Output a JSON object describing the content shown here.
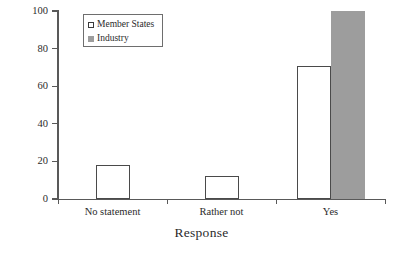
{
  "chart_data": {
    "type": "bar",
    "title": "",
    "subtitle": "",
    "xlabel": "Response",
    "ylabel": "Frequency (%)",
    "categories": [
      "No statement",
      "Rather not",
      "Yes"
    ],
    "series": [
      {
        "name": "Member States",
        "values": [
          18,
          12,
          71
        ],
        "color": "#ffffff",
        "edge_color": "#4a4a4a"
      },
      {
        "name": "Industry",
        "values": [
          0,
          0,
          100
        ],
        "color": "#9d9d9d",
        "edge_color": "#9d9d9d"
      }
    ],
    "ylim": [
      0,
      100
    ],
    "yticks": [
      0,
      20,
      40,
      60,
      80,
      100
    ],
    "ytick_labels": [
      "0",
      "20",
      "40",
      "60",
      "80",
      "100"
    ],
    "grid": false,
    "legend_position": "upper left",
    "legend_entries": [
      {
        "label": "Member States",
        "marker": "open-square-marker"
      },
      {
        "label": "Industry",
        "marker": "filled-square-marker"
      }
    ]
  },
  "axes": {
    "y_title": "Frequency (%)",
    "x_title": "Response"
  }
}
